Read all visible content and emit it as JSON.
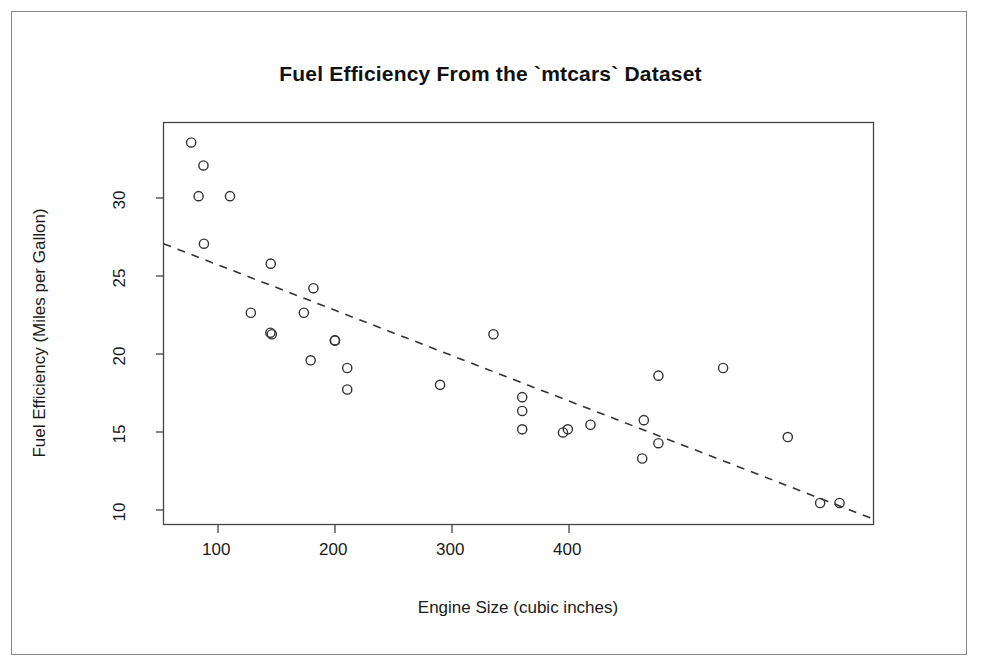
{
  "chart_data": {
    "type": "scatter",
    "title": "Fuel Efficiency From the `mtcars` Dataset",
    "xlabel": "Engine Size (cubic inches)",
    "ylabel": "Fuel Efficiency (Miles per Gallon)",
    "xlim": [
      54,
      493
    ],
    "ylim": [
      9.0,
      35.2
    ],
    "xticks": [
      100,
      200,
      300,
      400
    ],
    "xtick_labels": [
      "100",
      "200",
      "300",
      "400"
    ],
    "yticks": [
      10,
      15,
      20,
      25,
      30
    ],
    "ytick_labels": [
      "10",
      "15",
      "20",
      "25",
      "30"
    ],
    "grid": false,
    "legend": null,
    "marker": "open-circle",
    "marker_color": "#333333",
    "x": [
      160,
      160,
      108,
      258,
      360,
      225,
      360,
      146.7,
      140.8,
      167.6,
      167.6,
      275.8,
      275.8,
      275.8,
      472,
      460,
      440,
      78.7,
      75.7,
      71.1,
      120.1,
      318,
      304,
      350,
      400,
      79,
      120.3,
      95.1,
      351,
      145,
      301,
      121
    ],
    "y": [
      21.0,
      21.0,
      22.8,
      21.4,
      18.7,
      18.1,
      14.3,
      24.4,
      22.8,
      19.2,
      17.8,
      16.4,
      17.3,
      15.2,
      10.4,
      10.4,
      14.7,
      32.4,
      30.4,
      33.9,
      21.5,
      15.5,
      15.2,
      13.3,
      19.2,
      27.3,
      26.0,
      30.4,
      15.8,
      19.7,
      15.0,
      21.4
    ],
    "regression_line": {
      "style": "dashed",
      "color": "#333333",
      "x_start": 54,
      "y_start": 27.3,
      "x_end": 493,
      "y_end": 9.35
    }
  },
  "axes": {
    "title": "Fuel Efficiency From the `mtcars` Dataset",
    "x_title": "Engine Size (cubic inches)",
    "y_title": "Fuel Efficiency (Miles per Gallon)",
    "x_tick_labels": [
      "100",
      "200",
      "300",
      "400"
    ],
    "y_tick_labels": [
      "10",
      "15",
      "20",
      "25",
      "30"
    ]
  },
  "colors": {
    "frame": "#444444",
    "outer_border": "#8a8a8a",
    "marker": "#333333",
    "line": "#333333",
    "text": "#1a1a1a",
    "background": "#ffffff"
  }
}
